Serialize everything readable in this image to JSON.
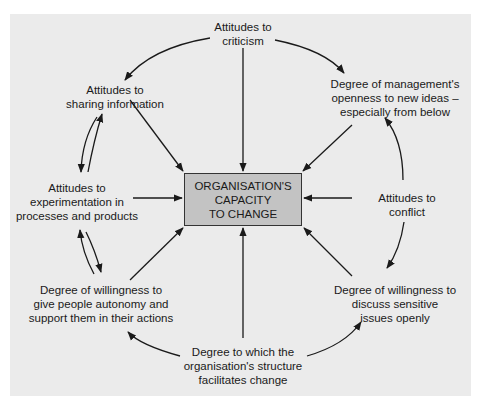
{
  "diagram": {
    "center": {
      "lines": [
        "ORGANISATION'S",
        "CAPACITY",
        "TO CHANGE"
      ],
      "fill_color": "#c3c3c3",
      "border_color": "#333333"
    },
    "nodes": {
      "criticism": {
        "lines": [
          "Attitudes to",
          "criticism"
        ]
      },
      "management": {
        "lines": [
          "Degree of management's",
          "openness to new ideas –",
          "especially from below"
        ]
      },
      "conflict": {
        "lines": [
          "Attitudes to",
          "conflict"
        ]
      },
      "discuss": {
        "lines": [
          "Degree of willingness to",
          "discuss sensitive",
          "issues openly"
        ]
      },
      "structure": {
        "lines": [
          "Degree to which the",
          "organisation's structure",
          "facilitates change"
        ]
      },
      "autonomy": {
        "lines": [
          "Degree of willingness to",
          "give people autonomy and",
          "support them in their actions"
        ]
      },
      "experimentation": {
        "lines": [
          "Attitudes to",
          "experimentation in",
          "processes and products"
        ]
      },
      "sharing": {
        "lines": [
          "Attitudes to",
          "sharing information"
        ]
      }
    },
    "edges": [
      {
        "from": "criticism",
        "to": "center"
      },
      {
        "from": "management",
        "to": "center"
      },
      {
        "from": "conflict",
        "to": "center"
      },
      {
        "from": "discuss",
        "to": "center"
      },
      {
        "from": "structure",
        "to": "center"
      },
      {
        "from": "autonomy",
        "to": "center"
      },
      {
        "from": "experimentation",
        "to": "center"
      },
      {
        "from": "sharing",
        "to": "center"
      },
      {
        "from": "criticism",
        "to": "management",
        "curved": true
      },
      {
        "from": "criticism",
        "to": "sharing",
        "curved": true
      },
      {
        "from": "conflict",
        "to": "management",
        "curved": true
      },
      {
        "from": "conflict",
        "to": "discuss",
        "curved": true
      },
      {
        "from": "structure",
        "to": "discuss",
        "curved": true
      },
      {
        "from": "structure",
        "to": "autonomy",
        "curved": true
      },
      {
        "from": "sharing",
        "to": "experimentation",
        "curved": true
      },
      {
        "from": "experimentation",
        "to": "sharing",
        "curved": true
      },
      {
        "from": "experimentation",
        "to": "autonomy",
        "curved": true
      },
      {
        "from": "autonomy",
        "to": "experimentation",
        "curved": true
      }
    ],
    "background_color": "#ebebeb",
    "line_color": "#1a1a1a"
  }
}
